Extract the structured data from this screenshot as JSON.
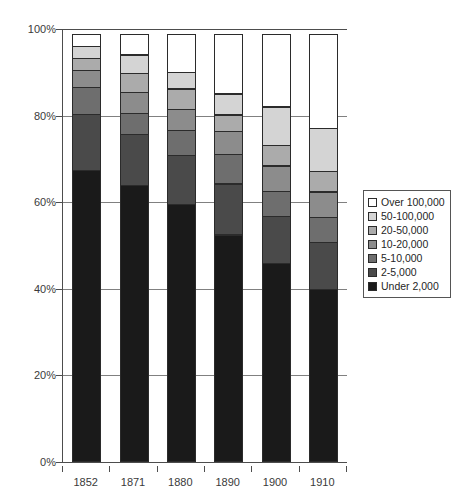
{
  "chart_data": {
    "type": "bar",
    "subtype": "stacked-percentage",
    "title": "",
    "xlabel": "",
    "ylabel": "",
    "categories": [
      "1852",
      "1871",
      "1880",
      "1890",
      "1900",
      "1910"
    ],
    "ylim": [
      0,
      100
    ],
    "y_ticks": [
      0,
      20,
      40,
      60,
      80,
      100
    ],
    "y_tick_labels": [
      "0%",
      "20%",
      "40%",
      "60%",
      "80%",
      "100%"
    ],
    "grid": true,
    "legend_position": "right-middle",
    "stack_order_bottom_to_top": [
      "Under 2,000",
      "2-5,000",
      "5-10,000",
      "10-20,000",
      "20-50,000",
      "50-100,000",
      "Over 100,000"
    ],
    "series": [
      {
        "name": "Under 2,000",
        "color": "#1a1a1a",
        "values": [
          67.5,
          64.0,
          59.5,
          52.5,
          46.0,
          40.0
        ]
      },
      {
        "name": "2-5,000",
        "color": "#4a4a4a",
        "values": [
          13.0,
          12.0,
          11.5,
          12.0,
          11.0,
          11.0
        ]
      },
      {
        "name": "5-10,000",
        "color": "#6e6e6e",
        "values": [
          6.5,
          5.0,
          6.0,
          7.0,
          6.0,
          6.0
        ]
      },
      {
        "name": "10-20,000",
        "color": "#8c8c8c",
        "values": [
          4.0,
          5.0,
          5.0,
          5.5,
          6.0,
          6.0
        ]
      },
      {
        "name": "20-50,000",
        "color": "#ababab",
        "values": [
          3.0,
          4.5,
          5.0,
          4.0,
          5.0,
          5.0
        ]
      },
      {
        "name": "50-100,000",
        "color": "#d4d4d4",
        "values": [
          3.0,
          4.5,
          4.0,
          5.0,
          9.0,
          10.0
        ]
      },
      {
        "name": "Over 100,000",
        "color": "#ffffff",
        "values": [
          3.0,
          5.0,
          9.0,
          14.0,
          17.0,
          22.0
        ]
      }
    ]
  },
  "legend": {
    "items": [
      {
        "label": "Over 100,000",
        "color": "#ffffff"
      },
      {
        "label": "50-100,000",
        "color": "#d4d4d4"
      },
      {
        "label": "20-50,000",
        "color": "#ababab"
      },
      {
        "label": "10-20,000",
        "color": "#8c8c8c"
      },
      {
        "label": "5-10,000",
        "color": "#6e6e6e"
      },
      {
        "label": "2-5,000",
        "color": "#4a4a4a"
      },
      {
        "label": "Under 2,000",
        "color": "#1a1a1a"
      }
    ]
  },
  "colors": {
    "axis": "#4d4d4d",
    "gridline": "#808080",
    "text": "#3a3a3a",
    "background": "#ffffff",
    "segment_border": "#2b2b2b"
  }
}
